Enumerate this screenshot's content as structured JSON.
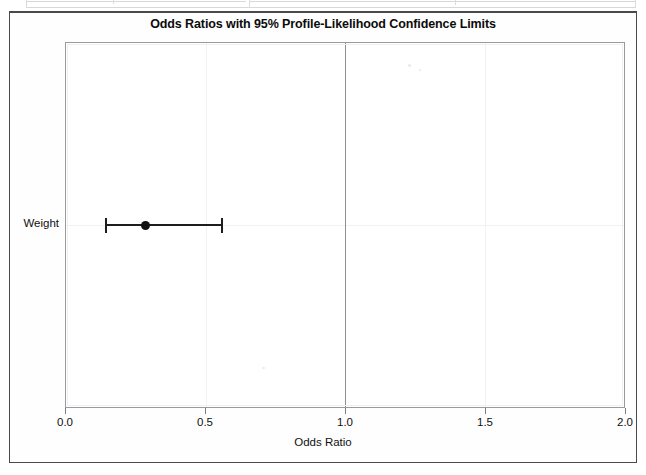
{
  "page": {
    "background_color": "#ffffff",
    "border_color": "#4a4a4a"
  },
  "title_box": {
    "title": "Odds Ratios with 95% Profile-Likelihood Confidence Limits"
  },
  "axes": {
    "x_axis_title": "Odds Ratio",
    "x_tick_labels": [
      "0.0",
      "0.5",
      "1.0",
      "1.5",
      "2.0"
    ],
    "y_category_label": "Weight"
  },
  "chart_data": {
    "type": "scatter",
    "title": "Odds Ratios with 95% Profile-Likelihood Confidence Limits",
    "subtitle": "",
    "xlabel": "Odds Ratio",
    "ylabel": "",
    "xlim": [
      0.0,
      2.0
    ],
    "x_ticks": [
      0.0,
      0.5,
      1.0,
      1.5,
      2.0
    ],
    "x_tick_labels": [
      "0.0",
      "0.5",
      "1.0",
      "1.5",
      "2.0"
    ],
    "categories": [
      "Weight"
    ],
    "grid": true,
    "legend": false,
    "reference_line": {
      "value": 1.0,
      "orientation": "vertical",
      "color": "#8f8f94"
    },
    "series": [
      {
        "name": "Odds Ratio Estimate",
        "marker": "filled-circle",
        "color": "#111111",
        "points": [
          {
            "category": "Weight",
            "estimate": 0.286,
            "ci_lower": 0.139,
            "ci_upper": 0.561,
            "ci_level": "95%",
            "ci_method": "Profile-Likelihood"
          }
        ]
      }
    ]
  },
  "colors": {
    "marker": "#111111",
    "interval": "#1d1d1d",
    "reference_line": "#8f8f94",
    "gridline": "#f1f1f3",
    "plot_border": "#9a9a9e"
  }
}
